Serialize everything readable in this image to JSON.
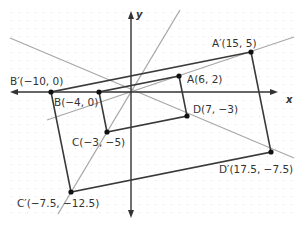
{
  "diagram": {
    "type": "dilation",
    "center": [
      0,
      0
    ],
    "scale_factor": 2.5,
    "axes": {
      "x_label": "x",
      "y_label": "y"
    },
    "colors": {
      "axis": "#333333",
      "polygon": "#3a3a3a",
      "ray": "#a6a6a6",
      "grid_dot": "#d9d9d9",
      "point": "#111111",
      "label": "#333333"
    },
    "original": {
      "points": [
        {
          "name": "A",
          "x": 6,
          "y": 2,
          "label": "A(6, 2)"
        },
        {
          "name": "B",
          "x": -4,
          "y": 0,
          "label": "B(−4, 0)"
        },
        {
          "name": "C",
          "x": -3,
          "y": -5,
          "label": "C(−3, −5)"
        },
        {
          "name": "D",
          "x": 7,
          "y": -3,
          "label": "D(7, −3)"
        }
      ]
    },
    "image": {
      "points": [
        {
          "name": "A'",
          "x": 15,
          "y": 5,
          "label": "A′(15, 5)"
        },
        {
          "name": "B'",
          "x": -10,
          "y": 0,
          "label": "B′(−10, 0)"
        },
        {
          "name": "C'",
          "x": -7.5,
          "y": -12.5,
          "label": "C′(−7.5, −12.5)"
        },
        {
          "name": "D'",
          "x": 17.5,
          "y": -7.5,
          "label": "D′(17.5, −7.5)"
        }
      ]
    }
  }
}
